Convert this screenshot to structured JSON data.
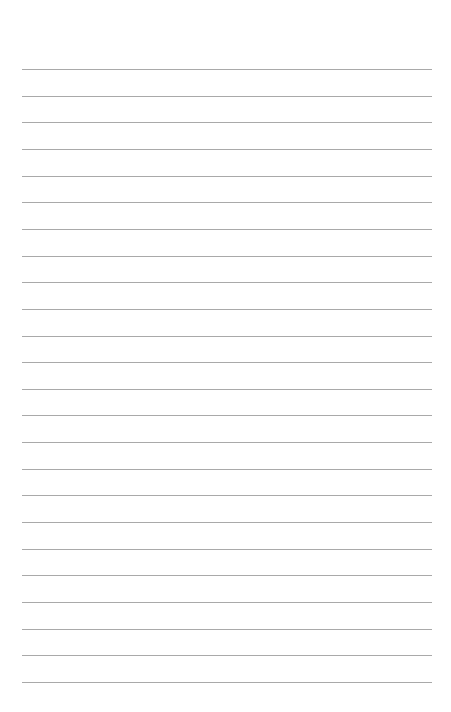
{
  "page": {
    "type": "ruled-paper",
    "line_count": 24,
    "line_color": "#a9a9a9",
    "background_color": "#ffffff",
    "text": []
  }
}
